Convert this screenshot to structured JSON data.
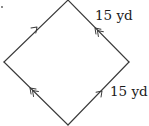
{
  "figure": {
    "shape": "parallelogram (rhombus)",
    "background": "#ffffff",
    "stroke_color": "#3a3a3a",
    "vertices": {
      "top": [
        68,
        0
      ],
      "right": [
        129,
        62
      ],
      "bottom": [
        68,
        125
      ],
      "left": [
        4,
        62
      ]
    },
    "edges": [
      {
        "name": "upper-left",
        "from": "left",
        "to": "top",
        "marker": "single-arrow",
        "direction": "toward-top"
      },
      {
        "name": "upper-right",
        "from": "right",
        "to": "top",
        "marker": "double-arrow",
        "direction": "toward-top"
      },
      {
        "name": "lower-left",
        "from": "bottom",
        "to": "left",
        "marker": "double-arrow",
        "direction": "toward-left"
      },
      {
        "name": "lower-right",
        "from": "bottom",
        "to": "right",
        "marker": "single-arrow",
        "direction": "toward-right"
      }
    ],
    "labels": {
      "upper_right_side": "15 yd",
      "lower_right_side": "15 yd"
    }
  }
}
